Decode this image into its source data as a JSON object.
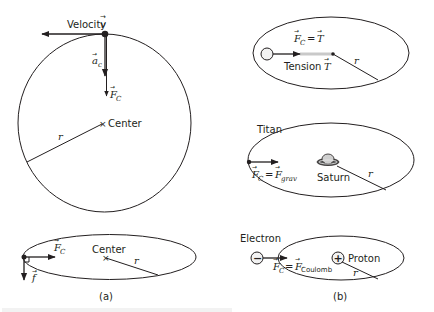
{
  "panel_a": {
    "caption": "(a)",
    "circle": {
      "velocity_label": "Velocity",
      "velocity_symbol": "v",
      "accel_symbol": "a",
      "accel_sub": "c",
      "force_symbol": "F",
      "force_sub": "C",
      "center_label": "Center",
      "radius_label": "r"
    },
    "ellipse": {
      "force_symbol": "F",
      "force_sub": "C",
      "center_label": "Center",
      "radius_label": "r",
      "tangent_symbol": "f"
    }
  },
  "panel_b": {
    "caption": "(b)",
    "tension": {
      "equation_lhs": "F",
      "equation_lhs_sub": "C",
      "equation_eq": "=",
      "equation_rhs": "T",
      "tension_label": "Tension",
      "tension_symbol": "T",
      "radius_label": "r"
    },
    "titan": {
      "body_label": "Titan",
      "planet_label": "Saturn",
      "equation_lhs": "F",
      "equation_lhs_sub": "C",
      "equation_eq": "=",
      "equation_rhs": "F",
      "equation_rhs_sub": "grav",
      "radius_label": "r"
    },
    "electron": {
      "particle_label": "Electron",
      "particle_sign": "−",
      "nucleus_label": "Proton",
      "nucleus_sign": "+",
      "equation_lhs": "F",
      "equation_lhs_sub": "C",
      "equation_eq": "=",
      "equation_rhs": "F",
      "equation_rhs_sub": "Coulomb",
      "radius_label": "r"
    }
  }
}
